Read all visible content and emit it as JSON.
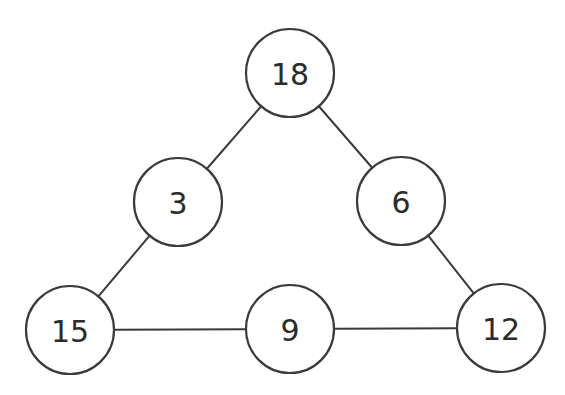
{
  "diagram": {
    "type": "number-triangle",
    "style": {
      "stroke_color": "#3a3a3a",
      "text_color": "#2b2b2b",
      "fill_color": "#ffffff",
      "radius": 44
    },
    "nodes": [
      {
        "id": "top",
        "label": "18",
        "cx": 290,
        "cy": 73
      },
      {
        "id": "left-mid",
        "label": "3",
        "cx": 178,
        "cy": 202
      },
      {
        "id": "right-mid",
        "label": "6",
        "cx": 401,
        "cy": 201
      },
      {
        "id": "bottom-left",
        "label": "15",
        "cx": 70,
        "cy": 330
      },
      {
        "id": "bottom-mid",
        "label": "9",
        "cx": 290,
        "cy": 329
      },
      {
        "id": "bottom-right",
        "label": "12",
        "cx": 501,
        "cy": 328
      }
    ],
    "edges": [
      {
        "from": "top",
        "to": "left-mid"
      },
      {
        "from": "top",
        "to": "right-mid"
      },
      {
        "from": "left-mid",
        "to": "bottom-left"
      },
      {
        "from": "right-mid",
        "to": "bottom-right"
      },
      {
        "from": "bottom-left",
        "to": "bottom-mid"
      },
      {
        "from": "bottom-mid",
        "to": "bottom-right"
      }
    ]
  }
}
